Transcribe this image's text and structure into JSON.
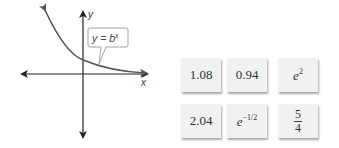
{
  "graph": {
    "x_axis_label": "x",
    "y_axis_label": "y",
    "callout": {
      "prefix": "y = b",
      "exponent": "x"
    },
    "curve": "decreasing exponential, 0 < b < 1"
  },
  "cards": [
    {
      "text": "1.08"
    },
    {
      "text": "0.94"
    },
    {
      "base": "e",
      "exponent": "2"
    },
    {
      "text": "2.04"
    },
    {
      "base": "e",
      "exponent": "−1/2"
    },
    {
      "numerator": "5",
      "denominator": "4"
    }
  ],
  "colors": {
    "axis": "#222222",
    "curve": "#555555",
    "card_bg": "#f1f1f1"
  }
}
